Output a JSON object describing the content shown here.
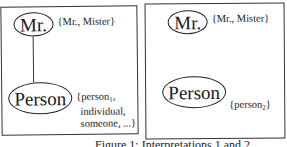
{
  "panels": [
    {
      "id": "interpretation-1",
      "nodes": [
        {
          "label": "Mr.",
          "synset": "{Mr., Mister}"
        },
        {
          "label": "Person",
          "synset_lines": [
            "{person",
            "individual,",
            "someone, ...}"
          ],
          "subscript": "1"
        }
      ],
      "edge": "Mr. — Person"
    },
    {
      "id": "interpretation-2",
      "nodes": [
        {
          "label": "Mr.",
          "synset": "{Mr., Mister}"
        },
        {
          "label": "Person",
          "synset_prefix": "{person",
          "subscript": "2",
          "synset_suffix": "}"
        }
      ]
    }
  ],
  "caption": "Figure 1: Interpretations 1 and 2"
}
